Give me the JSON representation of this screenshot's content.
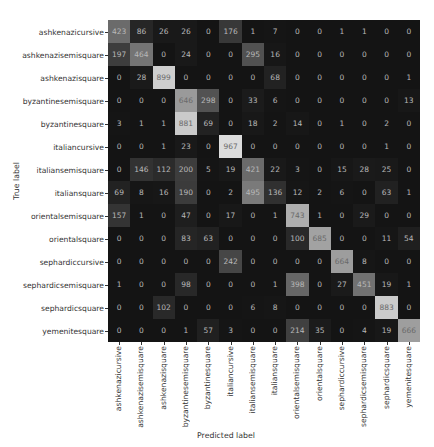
{
  "chart_data": {
    "type": "heatmap",
    "title": "",
    "xlabel": "Predicted label",
    "ylabel": "True label",
    "colormap": "grayscale (dark=low, light=high)",
    "labels": [
      "ashkenazicursive",
      "ashkenazisemisquare",
      "ashkenazisquare",
      "byzantinesemisquare",
      "byzantinesquare",
      "italiancursive",
      "italiansemisquare",
      "italiansquare",
      "orientalsemisquare",
      "orientalsquare",
      "sephardiccursive",
      "sephardicsemisquare",
      "sephardicsquare",
      "yemenitesquare"
    ],
    "matrix": [
      [
        423,
        86,
        26,
        26,
        0,
        176,
        1,
        7,
        0,
        0,
        1,
        1,
        0,
        0
      ],
      [
        197,
        464,
        0,
        24,
        0,
        0,
        295,
        16,
        0,
        0,
        0,
        0,
        0,
        0
      ],
      [
        0,
        28,
        899,
        0,
        0,
        0,
        0,
        68,
        0,
        0,
        0,
        0,
        0,
        1
      ],
      [
        0,
        0,
        0,
        646,
        298,
        0,
        33,
        6,
        0,
        0,
        0,
        0,
        0,
        13
      ],
      [
        3,
        1,
        1,
        881,
        69,
        0,
        18,
        2,
        14,
        0,
        1,
        0,
        2,
        0
      ],
      [
        0,
        0,
        1,
        23,
        0,
        967,
        0,
        0,
        0,
        0,
        0,
        0,
        1,
        0
      ],
      [
        0,
        146,
        112,
        200,
        5,
        19,
        421,
        22,
        3,
        0,
        15,
        28,
        25,
        0
      ],
      [
        69,
        8,
        16,
        190,
        0,
        2,
        495,
        136,
        12,
        2,
        6,
        0,
        63,
        1
      ],
      [
        157,
        1,
        0,
        47,
        0,
        17,
        0,
        1,
        743,
        1,
        0,
        29,
        0,
        0
      ],
      [
        0,
        0,
        0,
        83,
        63,
        0,
        0,
        0,
        100,
        685,
        0,
        0,
        11,
        54
      ],
      [
        0,
        0,
        0,
        0,
        0,
        242,
        0,
        0,
        0,
        0,
        664,
        8,
        0,
        0
      ],
      [
        1,
        0,
        0,
        98,
        0,
        0,
        0,
        1,
        398,
        0,
        27,
        451,
        19,
        1
      ],
      [
        0,
        0,
        102,
        0,
        0,
        0,
        6,
        8,
        0,
        0,
        0,
        0,
        883,
        0
      ],
      [
        0,
        0,
        0,
        1,
        57,
        3,
        0,
        0,
        214,
        35,
        0,
        4,
        19,
        666
      ]
    ],
    "vmax": 967,
    "grid": false,
    "legend": "none"
  }
}
